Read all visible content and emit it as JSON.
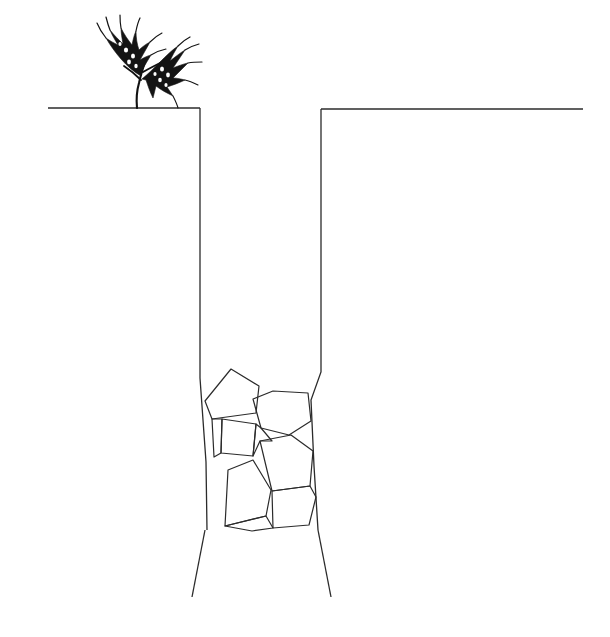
{
  "figure": {
    "title": "Cross-section of a deep narrow trench with rock fill and a grain plant at the surface",
    "background_color": "#ffffff",
    "ink_color": "#1a1a1a",
    "line_color": "#2b2b2b",
    "canvas": {
      "width": 610,
      "height": 637
    }
  },
  "ground": {
    "label": "ground-surface-line",
    "left_segment": {
      "x1": 48,
      "y1": 108,
      "x2": 200,
      "y2": 108
    },
    "right_segment": {
      "x1": 321,
      "y1": 109,
      "x2": 583,
      "y2": 109
    },
    "stroke_width": 1.4
  },
  "trench": {
    "label": "open trench cross-section",
    "left_wall": {
      "x": 200,
      "top_y": 108,
      "bottom_y": 378
    },
    "right_wall": {
      "x": 321,
      "top_y": 109,
      "bottom_y": 372
    },
    "left_wall_path": "M200,108 L200,378 L206,462 L207,530",
    "right_wall_path": "M321,109 L321,372 L311,400 L314,466 L318,530",
    "stroke_width": 1.3
  },
  "fracture": {
    "label": "splayed fracture lines below trench base",
    "left_splay": {
      "x1": 205,
      "y1": 530,
      "x2": 192,
      "y2": 597
    },
    "right_splay": {
      "x1": 318,
      "y1": 530,
      "x2": 331,
      "y2": 597
    },
    "stroke_width": 1.3
  },
  "rock_fill": {
    "label": "angular rock blocks filling lower trench",
    "count": 9,
    "stroke_width": 1.2,
    "blocks": [
      {
        "name": "rock-block-1",
        "points": "205,401 231,369 259,386 256,413 212,419"
      },
      {
        "name": "rock-block-2",
        "points": "253,399 273,391 308,393 311,421 289,435 261,428"
      },
      {
        "name": "rock-block-3",
        "points": "222,419 256,424 253,456 221,453"
      },
      {
        "name": "rock-block-4",
        "points": "260,441 291,435 313,451 310,486 272,491"
      },
      {
        "name": "rock-block-5",
        "points": "228,470 253,460 271,490 266,516 225,526"
      },
      {
        "name": "rock-block-6",
        "points": "272,491 310,486 316,497 309,525 273,528"
      },
      {
        "name": "rock-block-7",
        "points": "212,419 222,419 221,453 214,457"
      },
      {
        "name": "rock-block-8",
        "points": "256,424 261,428 272,441 260,441 253,456"
      },
      {
        "name": "rock-block-9",
        "points": "266,516 273,528 252,531 225,526"
      }
    ]
  },
  "plant": {
    "label": "grain-plant",
    "description": "small dark wheat-like plant with two seed heads",
    "stem_base": {
      "x": 137,
      "y": 108
    },
    "stroke_color": "#111111",
    "heads": 2,
    "stem_path": "M137,108 C136,98 137,90 139,83 C141,74 143,68 145,62",
    "branch_right_path": "M143,72 C150,68 158,64 166,60",
    "branch_left_path": "M141,80 C135,74 130,70 124,66"
  }
}
